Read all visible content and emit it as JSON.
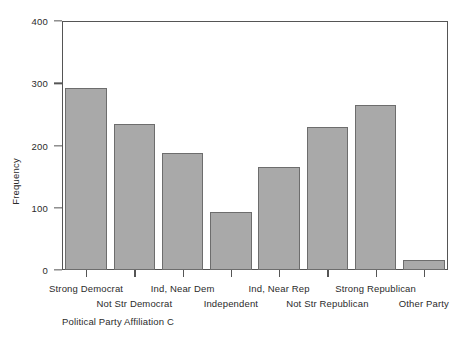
{
  "chart_data": {
    "type": "bar",
    "title": "",
    "xlabel": "Political Party Affiliation C",
    "ylabel": "Frequency",
    "categories": [
      "Strong Democrat",
      "Not Str Democrat",
      "Ind, Near Dem",
      "Independent",
      "Ind, Near Rep",
      "Not Str Republican",
      "Strong Republican",
      "Other Party"
    ],
    "values": [
      293,
      235,
      188,
      94,
      165,
      230,
      265,
      16
    ],
    "ylim": [
      0,
      400
    ],
    "yticks": [
      0,
      100,
      200,
      300,
      400
    ],
    "ytick_labels": [
      "0",
      "100",
      "200",
      "300",
      "400"
    ],
    "grid": false,
    "legend": false,
    "bar_fill_color": "#a9a9a9",
    "bar_border_color": "#6d6d6d",
    "axis_color": "#555555",
    "background_color": "#ffffff",
    "label_stagger": [
      "row-a",
      "row-b",
      "row-a",
      "row-b",
      "row-a",
      "row-b",
      "row-a",
      "row-b"
    ]
  }
}
